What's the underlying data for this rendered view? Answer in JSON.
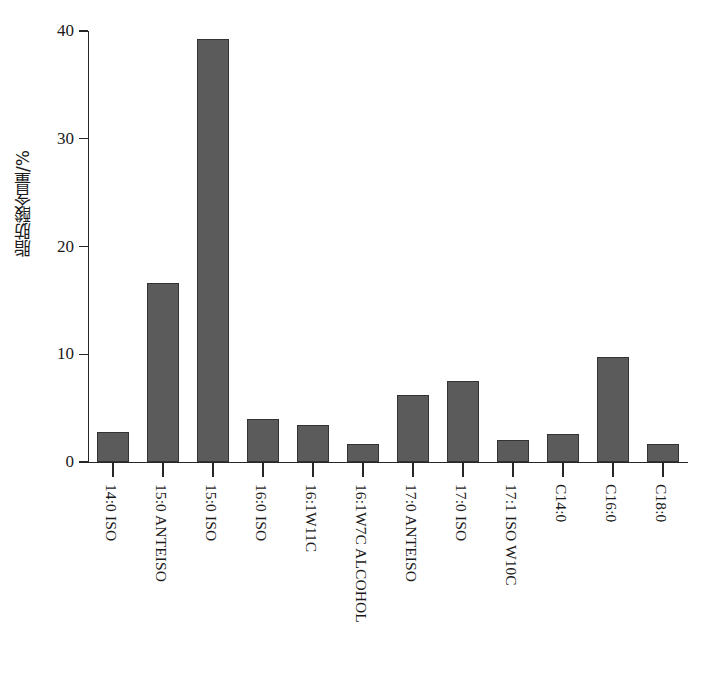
{
  "chart_data": {
    "type": "bar",
    "title": "",
    "subtitle": "",
    "xlabel": "",
    "ylabel": "脂肪酸含量/%",
    "ylim": [
      0,
      40
    ],
    "ytick_labels": [
      "0",
      "10",
      "20",
      "30",
      "40"
    ],
    "ytick_values": [
      0,
      10,
      20,
      30,
      40
    ],
    "grid": false,
    "legend": false,
    "bar_color": "#5b5b5b",
    "bar_edge_color": "#333333",
    "axis_color": "#262626",
    "categories": [
      "14:0 ISO",
      "15:0 ANTEISO",
      "15:0 ISO",
      "16:0 ISO",
      "16:1W11C",
      "16:1W7C ALCOHOL",
      "17:0 ANTEISO",
      "17:0 ISO",
      "17:1 ISO W10C",
      "C14:0",
      "C16:0",
      "C18:0"
    ],
    "values": [
      2.8,
      16.6,
      39.3,
      4.0,
      3.4,
      1.7,
      6.2,
      7.5,
      2.0,
      2.6,
      9.7,
      1.7
    ]
  }
}
